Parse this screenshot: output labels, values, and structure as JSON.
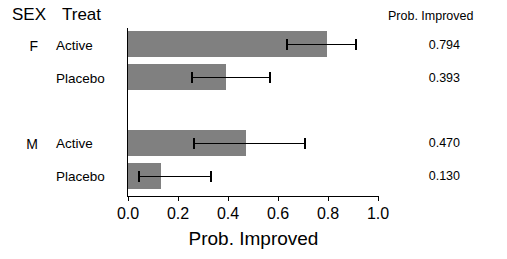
{
  "header": {
    "sex_label": "SEX",
    "treat_label": "Treat",
    "value_column_label": "Prob. Improved"
  },
  "axis": {
    "xtitle": "Prob. Improved",
    "ticks": [
      "0.0",
      "0.2",
      "0.4",
      "0.6",
      "0.8",
      "1.0"
    ]
  },
  "rows": [
    {
      "sex": "F",
      "treat": "Active",
      "value": "0.794"
    },
    {
      "sex": "",
      "treat": "Placebo",
      "value": "0.393"
    },
    {
      "sex": "M",
      "treat": "Active",
      "value": "0.470"
    },
    {
      "sex": "",
      "treat": "Placebo",
      "value": "0.130"
    }
  ],
  "chart_data": {
    "type": "bar",
    "orientation": "horizontal",
    "title": "",
    "xlabel": "Prob. Improved",
    "ylabel": "",
    "xlim": [
      0.0,
      1.0
    ],
    "xticks": [
      0.0,
      0.2,
      0.4,
      0.6,
      0.8,
      1.0
    ],
    "grid": false,
    "legend": "none",
    "categories": [
      "F Active",
      "F Placebo",
      "M Active",
      "M Placebo"
    ],
    "values": [
      0.794,
      0.393,
      0.47,
      0.13
    ],
    "error_bars": {
      "lower": [
        0.63,
        0.25,
        0.26,
        0.04
      ],
      "upper": [
        0.912,
        0.568,
        0.708,
        0.33
      ]
    },
    "data_labels": [
      "0.794",
      "0.393",
      "0.470",
      "0.130"
    ],
    "bar_color": "#808080"
  }
}
